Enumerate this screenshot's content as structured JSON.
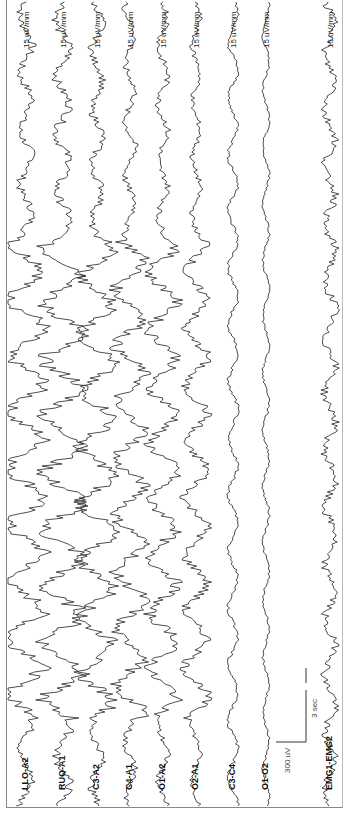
{
  "figure": {
    "orientation": "rotated -90deg (time runs bottom to top)",
    "scale_bar": {
      "amplitude_label": "300 uV",
      "time_label": "3 sec"
    }
  },
  "channels": [
    {
      "label": "LLO-A2",
      "sensitivity": "15 uV/mm",
      "x": 26,
      "amp": 22
    },
    {
      "label": "RUO-A1",
      "sensitivity": "15 uV/mm",
      "x": 63,
      "amp": 24
    },
    {
      "label": "C3-A2",
      "sensitivity": "15 uV/mm",
      "x": 97,
      "amp": 20
    },
    {
      "label": "C4-A1",
      "sensitivity": "15 uV/mm",
      "x": 130,
      "amp": 18
    },
    {
      "label": "O1-A2",
      "sensitivity": "15 uV/mm",
      "x": 163,
      "amp": 17
    },
    {
      "label": "O2-A1",
      "sensitivity": "15 uV/mm",
      "x": 196,
      "amp": 14
    },
    {
      "label": "C3-C4",
      "sensitivity": "15 uV/mm",
      "x": 233,
      "amp": 6
    },
    {
      "label": "O1-O2",
      "sensitivity": "15 uV/mm",
      "x": 266,
      "amp": 4
    },
    {
      "label": "EMG1-EMG2",
      "sensitivity": "15 uV/mm",
      "x": 330,
      "amp": 7
    }
  ],
  "chart_data": {
    "type": "line",
    "title": "",
    "subtitle": "Polysomnographic EEG montage (rotated 90°)",
    "xlabel": "time",
    "ylabel": "amplitude",
    "series": [
      {
        "name": "LLO-A2",
        "sensitivity": "15 uV/mm",
        "description": "high-amplitude slow waves in middle segment"
      },
      {
        "name": "RUO-A1",
        "sensitivity": "15 uV/mm",
        "description": "high-amplitude slow waves in middle segment"
      },
      {
        "name": "C3-A2",
        "sensitivity": "15 uV/mm",
        "description": "high-amplitude slow waves"
      },
      {
        "name": "C4-A1",
        "sensitivity": "15 uV/mm",
        "description": "mixed slow and fast activity"
      },
      {
        "name": "O1-A2",
        "sensitivity": "15 uV/mm",
        "description": "slow waves"
      },
      {
        "name": "O2-A1",
        "sensitivity": "15 uV/mm",
        "description": "fast mixed activity"
      },
      {
        "name": "C3-C4",
        "sensitivity": "15 uV/mm",
        "description": "low amplitude"
      },
      {
        "name": "O1-O2",
        "sensitivity": "15 uV/mm",
        "description": "low amplitude"
      },
      {
        "name": "EMG1-EMG2",
        "sensitivity": "15 uV/mm",
        "description": "fast, moderate amplitude"
      }
    ],
    "annotations": [
      "300 uV",
      "3 sec"
    ],
    "grid": false,
    "legend": "channel labels inline at bottom"
  }
}
